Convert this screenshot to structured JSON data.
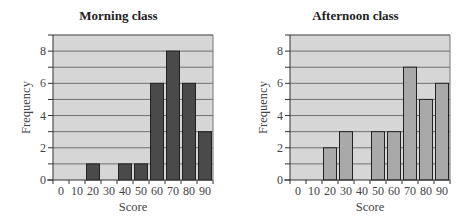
{
  "chart_data": [
    {
      "type": "bar",
      "title": "Morning class",
      "xlabel": "Score",
      "ylabel": "Frequency",
      "categories": [
        "0",
        "10",
        "20",
        "30",
        "40",
        "50",
        "60",
        "70",
        "80",
        "90"
      ],
      "values": [
        0,
        0,
        1,
        0,
        1,
        1,
        6,
        8,
        6,
        3
      ],
      "ylim": [
        0,
        9
      ],
      "yticks": [
        0,
        2,
        4,
        6,
        8
      ],
      "grid": true,
      "bar_color": "#4a4a4a",
      "background": "#d6d6d6"
    },
    {
      "type": "bar",
      "title": "Afternoon class",
      "xlabel": "Score",
      "ylabel": "Frequency",
      "categories": [
        "0",
        "10",
        "20",
        "30",
        "40",
        "50",
        "60",
        "70",
        "80",
        "90"
      ],
      "values": [
        0,
        0,
        2,
        3,
        0,
        3,
        3,
        7,
        5,
        6
      ],
      "ylim": [
        0,
        9
      ],
      "yticks": [
        0,
        2,
        4,
        6,
        8
      ],
      "grid": true,
      "bar_color": "#a9a9a9",
      "background": "#d6d6d6"
    }
  ]
}
